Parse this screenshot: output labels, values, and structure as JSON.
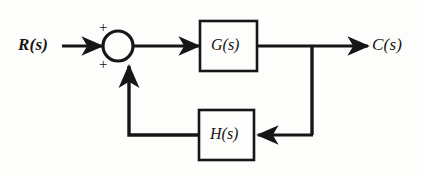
{
  "figure": {
    "kind": "control-system-block-diagram",
    "background_color": "#fdfdfb",
    "line_color": "#161616"
  },
  "labels": {
    "input": "R(s)",
    "output": "C(s)",
    "forward_block": "G(s)",
    "feedback_block": "H(s)",
    "summing_sign_top": "+",
    "summing_sign_bottom": "+"
  },
  "nodes": {
    "summing_junction": {
      "name": "summing-junction",
      "shape": "circle",
      "cx": 118,
      "cy": 46,
      "r": 15,
      "signs": [
        "+",
        "+"
      ]
    },
    "forward_block": {
      "name": "forward-path-block",
      "label": "G(s)",
      "x": 200,
      "y": 21,
      "width": 57,
      "height": 50
    },
    "feedback_block": {
      "name": "feedback-path-block",
      "label": "H(s)",
      "x": 199,
      "y": 110,
      "width": 55,
      "height": 50
    },
    "takeoff_point": {
      "name": "takeoff-point",
      "x": 312,
      "y": 46
    }
  },
  "signals": [
    {
      "name": "input-signal",
      "from": "R(s)",
      "to": "summing-junction",
      "direction": "right"
    },
    {
      "name": "error-signal",
      "from": "summing-junction",
      "to": "G(s)",
      "direction": "right"
    },
    {
      "name": "output-signal",
      "from": "G(s)",
      "to": "C(s)",
      "direction": "right"
    },
    {
      "name": "takeoff-branch",
      "from": "takeoff-point",
      "to": "H(s)",
      "direction": "left"
    },
    {
      "name": "feedback-signal",
      "from": "H(s)",
      "to": "summing-junction",
      "direction": "up"
    }
  ]
}
